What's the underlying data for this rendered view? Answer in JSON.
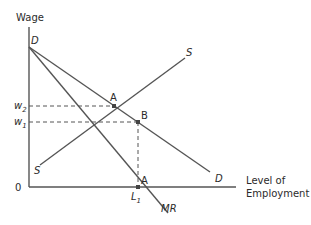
{
  "diagram": {
    "type": "monopsony-labor-market",
    "axes": {
      "y_label": "Wage",
      "x_label_line1": "Level of",
      "x_label_line2": "Employment",
      "origin_label": "0"
    },
    "curves": [
      {
        "name": "S",
        "label_start": "S",
        "label_end": "S",
        "description": "Supply curve (upward sloping)"
      },
      {
        "name": "D",
        "label_start": "D",
        "label_end": "D",
        "description": "Demand curve"
      },
      {
        "name": "MR",
        "label_end": "MR",
        "description": "Marginal revenue curve"
      }
    ],
    "points": [
      {
        "label": "A",
        "description": "Intersection of S and D at w2"
      },
      {
        "label": "B",
        "description": "Point on D at w1, above L1"
      },
      {
        "label": "A",
        "description": "Intersection of MR with horizontal axis at L1"
      }
    ],
    "tick_labels": {
      "w2": "w",
      "w2_sub": "2",
      "w1": "w",
      "w1_sub": "1",
      "L1": "L",
      "L1_sub": "1"
    }
  }
}
